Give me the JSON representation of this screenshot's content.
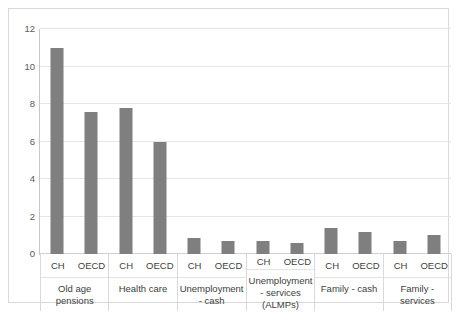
{
  "chart_data": {
    "type": "bar",
    "title": "",
    "subtitle": "",
    "xlabel": "",
    "ylabel": "",
    "ylim": [
      0,
      12
    ],
    "yticks": [
      0,
      2,
      4,
      6,
      8,
      10,
      12
    ],
    "ytick_labels": [
      "0",
      "2",
      "4",
      "6",
      "8",
      "10",
      "12"
    ],
    "grid": true,
    "legend": "none",
    "bar_color": "#7F7F7F",
    "gridline_color": "#E6E6E6",
    "border_color": "#D9D9D9",
    "categories": [
      "Old age pensions",
      "Health care",
      "Unemployment - cash",
      "Unemployment - services (ALMPs)",
      "Family - cash",
      "Family - services"
    ],
    "series_names": [
      "CH",
      "OECD"
    ],
    "series": [
      {
        "name": "CH",
        "values": [
          11.0,
          7.8,
          0.85,
          0.7,
          1.4,
          0.7
        ]
      },
      {
        "name": "OECD",
        "values": [
          7.6,
          6.0,
          0.7,
          0.6,
          1.2,
          1.0
        ]
      }
    ],
    "bars": [
      {
        "group": "Old age pensions",
        "series": "CH",
        "value": 11.0
      },
      {
        "group": "Old age pensions",
        "series": "OECD",
        "value": 7.6
      },
      {
        "group": "Health care",
        "series": "CH",
        "value": 7.8
      },
      {
        "group": "Health care",
        "series": "OECD",
        "value": 6.0
      },
      {
        "group": "Unemployment - cash",
        "series": "CH",
        "value": 0.85
      },
      {
        "group": "Unemployment - cash",
        "series": "OECD",
        "value": 0.7
      },
      {
        "group": "Unemployment - services (ALMPs)",
        "series": "CH",
        "value": 0.7
      },
      {
        "group": "Unemployment - services (ALMPs)",
        "series": "OECD",
        "value": 0.6
      },
      {
        "group": "Family - cash",
        "series": "CH",
        "value": 1.4
      },
      {
        "group": "Family - cash",
        "series": "OECD",
        "value": 1.2
      },
      {
        "group": "Family - services",
        "series": "CH",
        "value": 0.7
      },
      {
        "group": "Family - services",
        "series": "OECD",
        "value": 1.0
      }
    ],
    "groups": [
      {
        "label": "Old age pensions",
        "series": [
          {
            "label": "CH"
          },
          {
            "label": "OECD"
          }
        ]
      },
      {
        "label": "Health care",
        "series": [
          {
            "label": "CH"
          },
          {
            "label": "OECD"
          }
        ]
      },
      {
        "label": "Unemployment - cash",
        "series": [
          {
            "label": "CH"
          },
          {
            "label": "OECD"
          }
        ]
      },
      {
        "label": "Unemployment - services (ALMPs)",
        "series": [
          {
            "label": "CH"
          },
          {
            "label": "OECD"
          }
        ]
      },
      {
        "label": "Family - cash",
        "series": [
          {
            "label": "CH"
          },
          {
            "label": "OECD"
          }
        ]
      },
      {
        "label": "Family - services",
        "series": [
          {
            "label": "CH"
          },
          {
            "label": "OECD"
          }
        ]
      }
    ]
  }
}
